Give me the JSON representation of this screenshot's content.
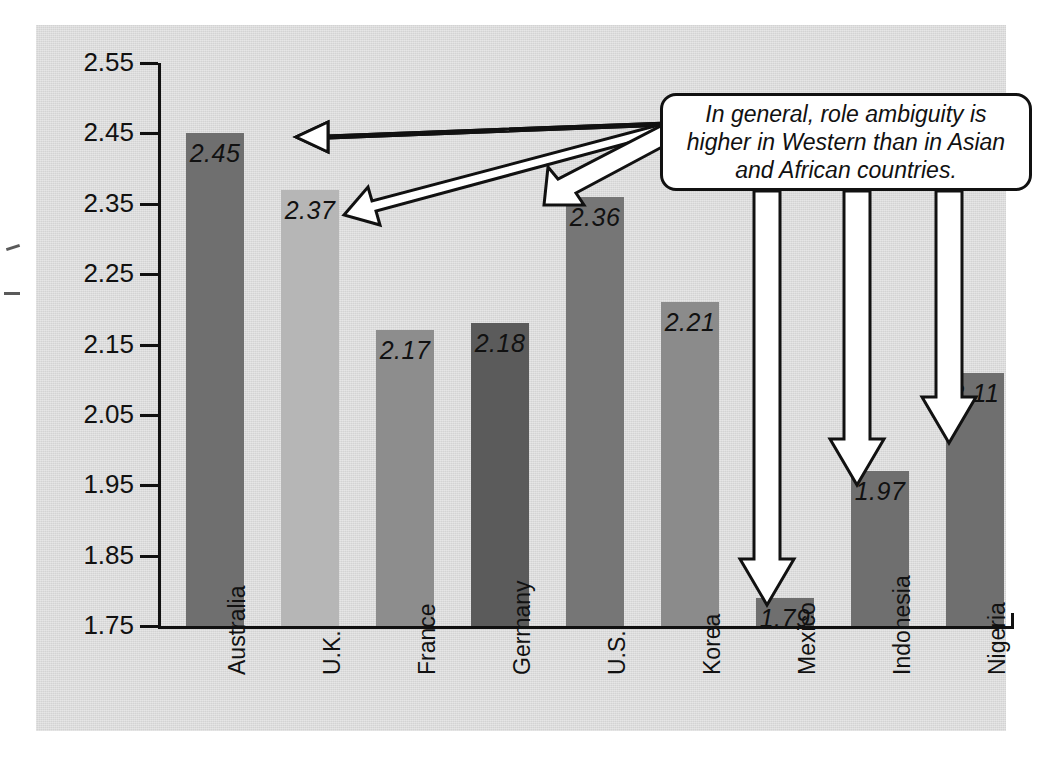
{
  "chart_data": {
    "type": "bar",
    "title": "",
    "xlabel": "",
    "ylabel": "Role Ambiguity",
    "categories": [
      "Australia",
      "U.K.",
      "France",
      "Germany",
      "U.S.",
      "Korea",
      "Mexico",
      "Indonesia",
      "Nigeria"
    ],
    "values": [
      2.45,
      2.37,
      2.17,
      2.18,
      2.36,
      2.21,
      1.79,
      1.97,
      2.11
    ],
    "value_labels": [
      "2.45",
      "2.37",
      "2.17",
      "2.18",
      "2.36",
      "2.21",
      "1.79",
      "1.97",
      "2.11"
    ],
    "bar_colors": [
      "#6f6f6f",
      "#b6b6b6",
      "#8d8d8d",
      "#5b5b5b",
      "#767676",
      "#8b8b8b",
      "#6f6f6f",
      "#6f6f6f",
      "#6f6f6f"
    ],
    "ylim": [
      1.75,
      2.55
    ],
    "ytick_labels": [
      "2.55",
      "2.45",
      "2.35",
      "2.25",
      "2.15",
      "2.05",
      "1.95",
      "1.85",
      "1.75"
    ],
    "ytick_values": [
      2.55,
      2.45,
      2.35,
      2.25,
      2.15,
      2.05,
      1.95,
      1.85,
      1.75
    ],
    "grid": false,
    "legend": "none",
    "annotations": [
      {
        "text": "In general, role ambiguity is higher in Western than in Asian and African countries.",
        "points_to": [
          "Australia",
          "U.K.",
          "U.S.",
          "Mexico",
          "Indonesia",
          "Nigeria"
        ]
      }
    ]
  },
  "callout": {
    "line1": "In general, role ambiguity is",
    "line2": "higher in Western than in Asian",
    "line3": "and African countries."
  },
  "axis": {
    "y_title": "Role Ambiguity"
  },
  "colors": {
    "panel_background": "#d9d9d9",
    "axis": "#111111",
    "callout_fill": "#ffffff",
    "callout_border": "#111111",
    "arrow_fill": "#ffffff",
    "arrow_stroke": "#111111"
  }
}
